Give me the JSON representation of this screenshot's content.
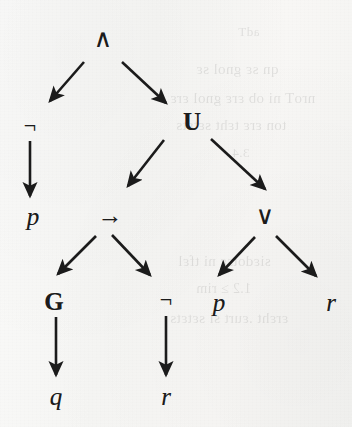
{
  "figure": {
    "kind": "parse-tree",
    "formula": "(¬p) ∧ ((p → G q) U (¬r ∨ (p ∨ r)))",
    "ink_color": "#1b1b1b",
    "paper_color": "#f7f7f6",
    "nodes": [
      {
        "id": "n-and",
        "label": "∧",
        "kind": "operator",
        "class": "op",
        "x": 103,
        "y": 38,
        "name": "node-conjunction"
      },
      {
        "id": "n-not1",
        "label": "¬",
        "kind": "operator",
        "class": "op-small",
        "x": 30,
        "y": 126,
        "name": "node-negation-1"
      },
      {
        "id": "n-until",
        "label": "U",
        "kind": "modal",
        "class": "modal",
        "x": 192,
        "y": 121,
        "name": "node-until"
      },
      {
        "id": "n-p1",
        "label": "p",
        "kind": "atom",
        "class": "atom",
        "x": 33,
        "y": 216,
        "name": "node-atom-p-1"
      },
      {
        "id": "n-imp",
        "label": "→",
        "kind": "operator",
        "class": "op",
        "x": 110,
        "y": 215,
        "name": "node-implication"
      },
      {
        "id": "n-or",
        "label": "∨",
        "kind": "operator",
        "class": "op",
        "x": 265,
        "y": 215,
        "name": "node-disjunction"
      },
      {
        "id": "n-globally",
        "label": "G",
        "kind": "modal",
        "class": "modal",
        "x": 54,
        "y": 301,
        "name": "node-globally"
      },
      {
        "id": "n-not2",
        "label": "¬",
        "kind": "operator",
        "class": "op-small",
        "x": 166,
        "y": 300,
        "name": "node-negation-2"
      },
      {
        "id": "n-p2",
        "label": "p",
        "kind": "atom",
        "class": "atom",
        "x": 219,
        "y": 302,
        "name": "node-atom-p-2"
      },
      {
        "id": "n-r1",
        "label": "r",
        "kind": "atom",
        "class": "atom",
        "x": 331,
        "y": 302,
        "name": "node-atom-r-1"
      },
      {
        "id": "n-q",
        "label": "q",
        "kind": "atom",
        "class": "atom",
        "x": 56,
        "y": 396,
        "name": "node-atom-q"
      },
      {
        "id": "n-r2",
        "label": "r",
        "kind": "atom",
        "class": "atom",
        "x": 166,
        "y": 396,
        "name": "node-atom-r-2"
      }
    ],
    "edges": [
      {
        "from": "n-and",
        "to": "n-not1",
        "x1": 84,
        "y1": 62,
        "x2": 50,
        "y2": 101,
        "name": "edge-and-to-not1"
      },
      {
        "from": "n-and",
        "to": "n-until",
        "x1": 122,
        "y1": 62,
        "x2": 166,
        "y2": 103,
        "name": "edge-and-to-until"
      },
      {
        "from": "n-not1",
        "to": "n-p1",
        "x1": 30,
        "y1": 141,
        "x2": 30,
        "y2": 196,
        "name": "edge-not1-to-p1"
      },
      {
        "from": "n-until",
        "to": "n-imp",
        "x1": 164,
        "y1": 140,
        "x2": 128,
        "y2": 186,
        "name": "edge-until-to-implication"
      },
      {
        "from": "n-until",
        "to": "n-or",
        "x1": 211,
        "y1": 139,
        "x2": 265,
        "y2": 189,
        "name": "edge-until-to-or"
      },
      {
        "from": "n-imp",
        "to": "n-globally",
        "x1": 96,
        "y1": 236,
        "x2": 58,
        "y2": 274,
        "name": "edge-implication-to-globally"
      },
      {
        "from": "n-imp",
        "to": "n-not2",
        "x1": 112,
        "y1": 235,
        "x2": 150,
        "y2": 275,
        "name": "edge-implication-to-not2"
      },
      {
        "from": "n-or",
        "to": "n-p2",
        "x1": 255,
        "y1": 237,
        "x2": 219,
        "y2": 275,
        "name": "edge-or-to-p2"
      },
      {
        "from": "n-or",
        "to": "n-r1",
        "x1": 276,
        "y1": 236,
        "x2": 316,
        "y2": 276,
        "name": "edge-or-to-r1"
      },
      {
        "from": "n-globally",
        "to": "n-q",
        "x1": 56,
        "y1": 317,
        "x2": 56,
        "y2": 375,
        "name": "edge-globally-to-q"
      },
      {
        "from": "n-not2",
        "to": "n-r2",
        "x1": 166,
        "y1": 316,
        "x2": 166,
        "y2": 375,
        "name": "edge-not2-to-r2"
      }
    ]
  },
  "bleed_through": [
    {
      "text": "adT",
      "x": 238,
      "y": 24,
      "size": 13,
      "name": "bleed-line-1"
    },
    {
      "text": "qn sε gnol sε",
      "x": 196,
      "y": 61,
      "size": 15,
      "name": "bleed-line-2"
    },
    {
      "text": "nroT ni ob εrε gnol εrε",
      "x": 170,
      "y": 90,
      "size": 15,
      "name": "bleed-line-3"
    },
    {
      "text": "ton εrε tεht sεtεts",
      "x": 176,
      "y": 117,
      "size": 15,
      "name": "bleed-line-4"
    },
    {
      "text": "3.4",
      "x": 232,
      "y": 145,
      "size": 13,
      "name": "bleed-line-5"
    },
    {
      "text": "siεdotsε ni tfεl",
      "x": 178,
      "y": 253,
      "size": 15,
      "name": "bleed-line-6"
    },
    {
      "text": "1.2 ≥ rim",
      "x": 196,
      "y": 281,
      "size": 14,
      "name": "bleed-line-7"
    },
    {
      "text": "εrεht .εurt si sεtεts",
      "x": 170,
      "y": 310,
      "size": 15,
      "name": "bleed-line-8"
    }
  ]
}
